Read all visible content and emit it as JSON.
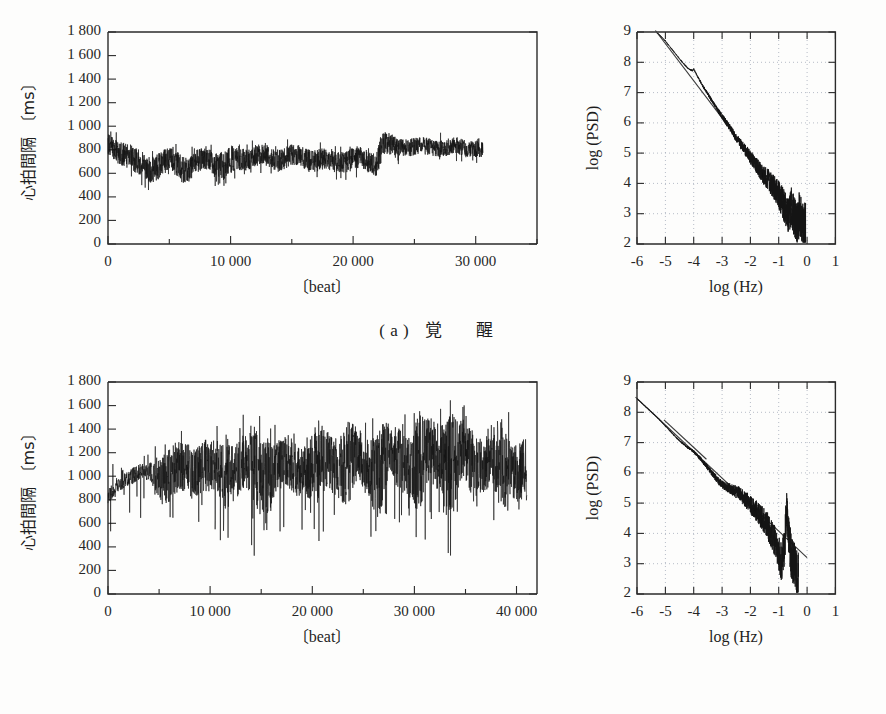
{
  "figure": {
    "panels": [
      {
        "id": "a",
        "caption_label": "( a )",
        "caption_text": "覚 醒",
        "caption_reading": "wakefulness"
      },
      {
        "id": "b",
        "caption_label": "( b )",
        "caption_text": "睡 眠",
        "caption_reading": "sleep"
      }
    ]
  },
  "chart_data": [
    {
      "panel": "a",
      "position": "top-left",
      "type": "line",
      "title": "",
      "xlabel": "〔beat〕",
      "ylabel": "心拍間隔 〔ms〕",
      "ylabel_unit": "ms",
      "xlim": [
        0,
        35000
      ],
      "ylim": [
        0,
        1800
      ],
      "xticks": [
        0,
        10000,
        20000,
        30000
      ],
      "xticklabels": [
        "0",
        "10 000",
        "20 000",
        "30 000"
      ],
      "xminorticks": [
        5000,
        15000,
        25000,
        35000
      ],
      "yticks": [
        0,
        200,
        400,
        600,
        800,
        1000,
        1200,
        1400,
        1600,
        1800
      ],
      "yticklabels": [
        "0",
        "200",
        "400",
        "600",
        "800",
        "1 000",
        "1 200",
        "1 400",
        "1 600",
        "1 800"
      ],
      "grid": false,
      "data_extent_x": [
        0,
        30600
      ],
      "series_description": "RR interval time series during wakefulness; dense noisy band centered near 700-800 ms with excursions from ~430 to ~1000 ms",
      "envelope": {
        "x": [
          0,
          700,
          1500,
          2400,
          3300,
          4200,
          5000,
          5800,
          6400,
          6900,
          7600,
          8400,
          9000,
          9700,
          10500,
          11400,
          12300,
          13200,
          14100,
          15000,
          15900,
          16800,
          17700,
          18600,
          19500,
          20400,
          21200,
          21900,
          22300,
          22800,
          23600,
          24500,
          25500,
          26500,
          27500,
          28500,
          29500,
          30600
        ],
        "upper": [
          930,
          900,
          880,
          800,
          760,
          790,
          810,
          800,
          760,
          790,
          800,
          810,
          800,
          820,
          830,
          840,
          840,
          830,
          830,
          840,
          830,
          820,
          810,
          800,
          810,
          820,
          800,
          790,
          960,
          930,
          900,
          910,
          900,
          900,
          890,
          900,
          890,
          880
        ],
        "lower": [
          740,
          700,
          650,
          560,
          520,
          560,
          600,
          560,
          500,
          560,
          600,
          620,
          500,
          540,
          620,
          640,
          650,
          640,
          620,
          650,
          640,
          620,
          610,
          600,
          610,
          620,
          600,
          580,
          700,
          720,
          740,
          750,
          740,
          750,
          740,
          750,
          740,
          720
        ],
        "mean": [
          830,
          800,
          760,
          680,
          640,
          670,
          700,
          680,
          630,
          670,
          700,
          720,
          660,
          680,
          720,
          740,
          745,
          735,
          725,
          745,
          735,
          720,
          710,
          700,
          710,
          720,
          700,
          690,
          830,
          830,
          820,
          830,
          820,
          825,
          815,
          825,
          815,
          800
        ]
      }
    },
    {
      "panel": "a",
      "position": "top-right",
      "type": "line",
      "title": "",
      "xlabel": "log (Hz)",
      "ylabel": "log (PSD)",
      "xlim": [
        -6,
        1
      ],
      "ylim": [
        2,
        9
      ],
      "xticks": [
        -6,
        -5,
        -4,
        -3,
        -2,
        -1,
        0,
        1
      ],
      "xticklabels": [
        "-6",
        "-5",
        "-4",
        "-3",
        "-2",
        "-1",
        "0",
        "1"
      ],
      "yticks": [
        2,
        3,
        4,
        5,
        6,
        7,
        8,
        9
      ],
      "yticklabels": [
        "2",
        "3",
        "4",
        "5",
        "6",
        "7",
        "8",
        "9"
      ],
      "grid": true,
      "grid_style": "dotted",
      "series_description": "1/f-like power spectral density during wakefulness; approximately linear decay with slope about -1.2 plus broadband scatter above log(Hz) = -1.5",
      "spectrum": {
        "x": [
          -5.3,
          -5.0,
          -4.7,
          -4.4,
          -4.2,
          -4.05,
          -4.0,
          -3.9,
          -3.7,
          -3.4,
          -3.1,
          -2.8,
          -2.5,
          -2.3,
          -2.1,
          -1.9,
          -1.7,
          -1.5,
          -1.3,
          -1.1,
          -0.95,
          -0.85,
          -0.75,
          -0.65,
          -0.55,
          -0.45,
          -0.35,
          -0.25,
          -0.15,
          -0.05
        ],
        "y": [
          9.0,
          8.7,
          8.35,
          8.0,
          7.8,
          7.72,
          7.78,
          7.6,
          7.25,
          6.8,
          6.35,
          5.95,
          5.5,
          5.25,
          5.0,
          4.75,
          4.5,
          4.25,
          4.05,
          3.75,
          3.55,
          3.35,
          3.1,
          2.95,
          3.25,
          2.85,
          2.7,
          3.05,
          2.6,
          2.5
        ]
      },
      "fit_line": {
        "x": [
          -5.35,
          -0.1
        ],
        "y": [
          9.05,
          2.6
        ],
        "slope_note": "approx -1.2"
      }
    },
    {
      "panel": "b",
      "position": "bottom-left",
      "type": "line",
      "title": "",
      "xlabel": "〔beat〕",
      "ylabel": "心拍間隔 〔ms〕",
      "ylabel_unit": "ms",
      "xlim": [
        0,
        42000
      ],
      "ylim": [
        0,
        1800
      ],
      "xticks": [
        0,
        10000,
        20000,
        30000,
        40000
      ],
      "xticklabels": [
        "0",
        "10 000",
        "20 000",
        "30 000",
        "40 000"
      ],
      "xminorticks": [
        5000,
        15000,
        25000,
        35000
      ],
      "yticks": [
        0,
        200,
        400,
        600,
        800,
        1000,
        1200,
        1400,
        1600,
        1800
      ],
      "yticklabels": [
        "0",
        "200",
        "400",
        "600",
        "800",
        "1 000",
        "1 200",
        "1 400",
        "1 600",
        "1 800"
      ],
      "grid": false,
      "data_extent_x": [
        0,
        41000
      ],
      "series_description": "RR interval time series during sleep; rises from ~800 ms to ~1100 ms with large downward spikes reaching ~450 ms and upward excursions to ~1550 ms",
      "envelope": {
        "x": [
          0,
          800,
          1700,
          2600,
          3500,
          4500,
          5500,
          6500,
          7500,
          8500,
          9500,
          10500,
          11500,
          12500,
          13500,
          14500,
          15500,
          16500,
          17500,
          18500,
          19500,
          20500,
          21500,
          22500,
          23500,
          24500,
          25500,
          26500,
          27500,
          28500,
          29500,
          30500,
          31500,
          32500,
          33500,
          34500,
          35500,
          36500,
          37500,
          38500,
          39500,
          41000
        ],
        "upper": [
          880,
          980,
          1030,
          1080,
          1100,
          1120,
          1180,
          1240,
          1270,
          1300,
          1320,
          1300,
          1290,
          1330,
          1360,
          1370,
          1310,
          1290,
          1330,
          1340,
          1300,
          1350,
          1420,
          1450,
          1400,
          1380,
          1370,
          1400,
          1430,
          1420,
          1400,
          1450,
          1480,
          1540,
          1520,
          1470,
          1430,
          1440,
          1420,
          1400,
          1390,
          1300
        ],
        "lower": [
          740,
          850,
          900,
          930,
          950,
          900,
          700,
          760,
          820,
          800,
          840,
          820,
          700,
          830,
          850,
          600,
          560,
          840,
          860,
          840,
          820,
          600,
          900,
          900,
          620,
          880,
          840,
          560,
          900,
          880,
          860,
          520,
          880,
          900,
          480,
          860,
          850,
          880,
          860,
          560,
          840,
          700
        ],
        "mean": [
          800,
          920,
          980,
          1010,
          1030,
          1020,
          1000,
          1030,
          1060,
          1060,
          1080,
          1060,
          1030,
          1080,
          1100,
          1050,
          1010,
          1070,
          1090,
          1090,
          1070,
          1060,
          1120,
          1140,
          1080,
          1120,
          1110,
          1060,
          1150,
          1150,
          1130,
          1080,
          1170,
          1200,
          1080,
          1160,
          1140,
          1160,
          1140,
          1050,
          1120,
          1050
        ]
      }
    },
    {
      "panel": "b",
      "position": "bottom-right",
      "type": "line",
      "title": "",
      "xlabel": "log (Hz)",
      "ylabel": "log (PSD)",
      "xlim": [
        -6,
        1
      ],
      "ylim": [
        2,
        9
      ],
      "xticks": [
        -6,
        -5,
        -4,
        -3,
        -2,
        -1,
        0,
        1
      ],
      "xticklabels": [
        "-6",
        "-5",
        "-4",
        "-3",
        "-2",
        "-1",
        "0",
        "1"
      ],
      "yticks": [
        2,
        3,
        4,
        5,
        6,
        7,
        8,
        9
      ],
      "yticklabels": [
        "2",
        "3",
        "4",
        "5",
        "6",
        "7",
        "8",
        "9"
      ],
      "grid": true,
      "grid_style": "dotted",
      "series_description": "Power spectral density during sleep; near-linear 1/f decay with a pronounced respiratory peak reaching log(PSD) about 4.7 near log(Hz) = -0.7",
      "spectrum": {
        "x": [
          -6.0,
          -5.6,
          -5.2,
          -4.9,
          -4.6,
          -4.3,
          -4.0,
          -3.7,
          -3.4,
          -3.1,
          -2.9,
          -2.75,
          -2.6,
          -2.45,
          -2.3,
          -2.15,
          -2.0,
          -1.85,
          -1.7,
          -1.55,
          -1.4,
          -1.25,
          -1.1,
          -1.0,
          -0.9,
          -0.8,
          -0.72,
          -0.66,
          -0.6,
          -0.55,
          -0.5,
          -0.45,
          -0.4,
          -0.35,
          -0.3
        ],
        "y": [
          8.45,
          8.1,
          7.75,
          7.45,
          7.15,
          6.9,
          6.7,
          6.4,
          6.05,
          5.7,
          5.55,
          5.5,
          5.42,
          5.35,
          5.25,
          5.1,
          4.95,
          4.8,
          4.65,
          4.45,
          4.25,
          4.0,
          3.7,
          3.35,
          3.05,
          3.6,
          4.7,
          4.2,
          3.6,
          3.1,
          3.0,
          3.15,
          2.85,
          2.6,
          3.0
        ]
      },
      "fit_line": {
        "x": [
          -6.05,
          0.0
        ],
        "y": [
          8.5,
          3.2
        ],
        "slope_note": "approx -0.87"
      },
      "fit_line_secondary": {
        "x": [
          -5.05,
          -3.55
        ],
        "y": [
          7.75,
          6.45
        ]
      }
    }
  ]
}
